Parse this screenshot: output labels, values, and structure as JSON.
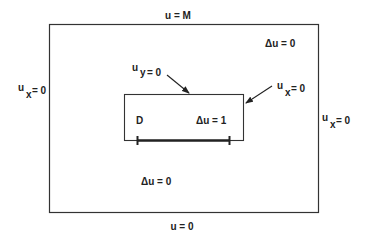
{
  "diagram": {
    "outer_region": {
      "top_boundary": "u = M",
      "bottom_boundary": "u = 0",
      "left_boundary": {
        "base": "u",
        "sub": "x",
        "rest": "= 0"
      },
      "right_boundary": {
        "base": "u",
        "sub": "x",
        "rest": "= 0"
      },
      "interior_top_right": "Δu = 0",
      "interior_bottom_left": "Δu = 0"
    },
    "inner_region": {
      "name": "D",
      "equation": "Δu = 1",
      "top_boundary_callout": {
        "base": "u",
        "sub": "y",
        "rest": "= 0"
      },
      "right_boundary_callout": {
        "base": "u",
        "sub": "x",
        "rest": "= 0"
      }
    },
    "colors": {
      "line": "#222222",
      "background": "#ffffff"
    }
  }
}
